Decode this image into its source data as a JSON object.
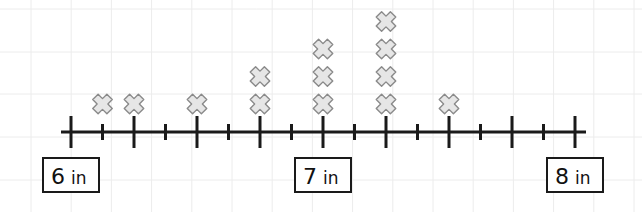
{
  "chart_data": {
    "type": "line-plot",
    "title": "",
    "xlabel": "",
    "ylabel": "",
    "unit": "in",
    "xlim": [
      6,
      8
    ],
    "major_tick_step": 0.25,
    "minor_tick_step": 0.125,
    "grid": true,
    "labeled_ticks": [
      {
        "value": 6,
        "number": "6",
        "unit": "in"
      },
      {
        "value": 7,
        "number": "7",
        "unit": "in"
      },
      {
        "value": 8,
        "number": "8",
        "unit": "in"
      }
    ],
    "marker": "x",
    "points": [
      {
        "x": 6.125,
        "count": 1
      },
      {
        "x": 6.25,
        "count": 1
      },
      {
        "x": 6.5,
        "count": 1
      },
      {
        "x": 6.75,
        "count": 2
      },
      {
        "x": 7.0,
        "count": 3
      },
      {
        "x": 7.25,
        "count": 4
      },
      {
        "x": 7.5,
        "count": 1
      }
    ],
    "colors": {
      "axis": "#1a1a1a",
      "marker_fill": "#e6e6e6",
      "marker_stroke": "#8a8a8a",
      "grid": "#ececec"
    }
  }
}
